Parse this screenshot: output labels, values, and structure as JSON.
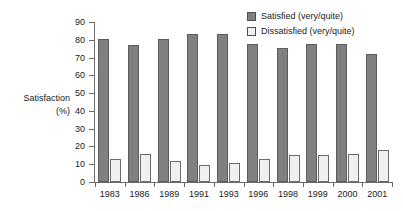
{
  "axis_title": {
    "line1": "Satisfaction",
    "line2": "(%)"
  },
  "legend": {
    "items": [
      {
        "label": "Satisfied (very/quite)",
        "color": "#808080",
        "swatch": "filled-gray-swatch"
      },
      {
        "label": "Dissatisfied (very/quite)",
        "color": "#f0f0f0",
        "swatch": "outlined-white-swatch"
      }
    ]
  },
  "chart_data": {
    "type": "bar",
    "title": "",
    "subtitle": "",
    "xlabel": "",
    "ylabel": "Satisfaction (%)",
    "ylim": [
      0,
      90
    ],
    "ytick_step": 10,
    "yticks": [
      0,
      10,
      20,
      30,
      40,
      50,
      60,
      70,
      80,
      90
    ],
    "grid": false,
    "legend_position": "top-right",
    "categories": [
      "1983",
      "1986",
      "1989",
      "1991",
      "1993",
      "1996",
      "1998",
      "1999",
      "2000",
      "2001"
    ],
    "series": [
      {
        "name": "Satisfied (very/quite)",
        "color": "#808080",
        "values": [
          80.5,
          77,
          80.5,
          83,
          83,
          77.5,
          75.5,
          77.5,
          77.5,
          72
        ]
      },
      {
        "name": "Dissatisfied (very/quite)",
        "color": "#f0f0f0",
        "values": [
          13,
          15.5,
          12,
          9.5,
          10.5,
          13,
          15,
          15,
          15.5,
          18
        ]
      }
    ]
  }
}
